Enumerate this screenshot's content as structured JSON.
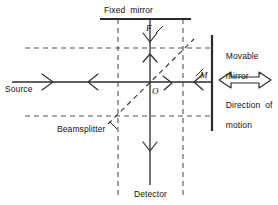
{
  "figure": {
    "type": "optics-ray-diagram",
    "background_color": "#ffffff",
    "line_color": "#2b2b2b",
    "dash_color": "#4a4a4a",
    "text_color": "#111111"
  },
  "labels": {
    "fixed_mirror": "Fixed  mirror",
    "movable_mirror_line1": "Movable",
    "movable_mirror_line2": "mirror",
    "source": "Source",
    "beamsplitter": "Beamsplitter",
    "detector": "Detector",
    "direction_line1": "Direction  of",
    "direction_line2": "motion",
    "point_f": "F",
    "point_m": "M",
    "point_o": "O"
  },
  "components": {
    "fixed_mirror": {
      "kind": "mirror",
      "orientation": "horizontal",
      "x1": 100,
      "x2": 191,
      "y": 19
    },
    "movable_mirror": {
      "kind": "mirror",
      "orientation": "vertical",
      "x": 212,
      "y1": 35,
      "y2": 131
    },
    "beamsplitter": {
      "kind": "beamsplitter",
      "orientation": "diagonal-45",
      "x1": 108,
      "y1": 124,
      "x2": 194,
      "y2": 39
    },
    "detector": {
      "kind": "detector",
      "x": 150,
      "y": 185
    }
  },
  "beams": {
    "source_beam": {
      "from": [
        12,
        82
      ],
      "to": [
        150,
        82
      ],
      "style": "solid"
    },
    "movable_arm": {
      "from": [
        150,
        82
      ],
      "to": [
        212,
        82
      ],
      "style": "solid"
    },
    "fixed_arm": {
      "from": [
        150,
        19
      ],
      "to": [
        150,
        82
      ],
      "style": "solid"
    },
    "detector_beam": {
      "from": [
        150,
        82
      ],
      "to": [
        150,
        185
      ],
      "style": "solid"
    }
  },
  "construction_lines": {
    "upper_horizontal_dashed": {
      "y": 48,
      "x1": 25,
      "x2": 212
    },
    "lower_horizontal_dashed": {
      "y": 116,
      "x1": 25,
      "x2": 212
    },
    "left_vertical_dashed": {
      "x": 118,
      "y1": 19,
      "y2": 196
    },
    "right_vertical_dashed": {
      "x": 183,
      "y1": 19,
      "y2": 196
    }
  },
  "motion_arrow": {
    "kind": "double-headed-arrow",
    "x1": 218,
    "x2": 272,
    "y": 80,
    "meaning": "Direction of motion"
  }
}
